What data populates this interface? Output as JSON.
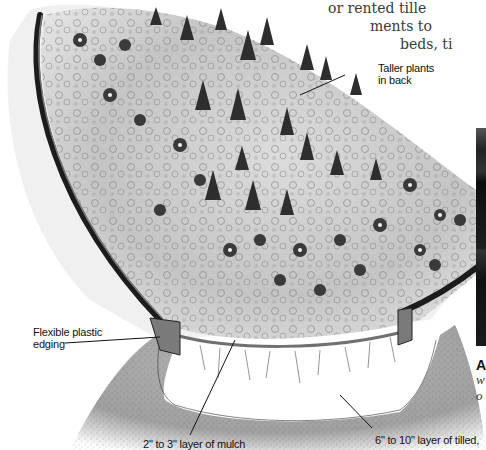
{
  "body_text": {
    "lines": [
      "or rented tille",
      "ments to",
      "beds, ti"
    ]
  },
  "illustration": {
    "subject": "cross-section of raised flower bed with flexible plastic edging",
    "labels": {
      "taller_plants": [
        "Taller plants",
        "in back"
      ],
      "edging": [
        "Flexible plastic",
        "edging"
      ],
      "mulch": "2\" to 3\" layer of mulch",
      "soil": "6\" to 10\" layer of tilled,"
    }
  },
  "photo_caption": {
    "bold_start": "A",
    "italic_lines": [
      "w",
      "o"
    ]
  },
  "colors": {
    "ink": "#111111",
    "edging": "#1c1c1c",
    "soil": "#9a9a9a",
    "plants_dark": "#2a2a2a",
    "plants_light": "#c8c8c8"
  }
}
